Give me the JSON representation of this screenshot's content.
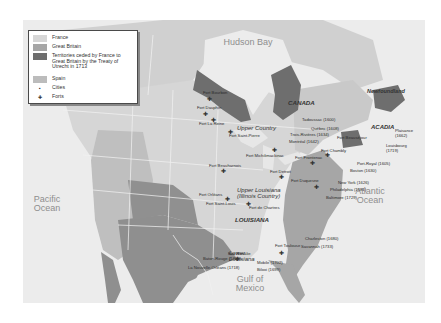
{
  "legend": {
    "items": [
      {
        "label": "France",
        "type": "swatch",
        "color": "#d6d6d6"
      },
      {
        "label": "Great Britain",
        "type": "swatch",
        "color": "#a6a6a6"
      },
      {
        "label": "Territories ceded by France to Great Britain by the Treaty of Utrecht in 1713",
        "type": "swatch",
        "color": "#6e6e6e"
      },
      {
        "label": "Spain",
        "type": "swatch",
        "color": "#bcbcbc"
      },
      {
        "label": "Cities",
        "type": "symbol",
        "symbol": "city-dot-icon"
      },
      {
        "label": "Forts",
        "type": "symbol",
        "symbol": "fort-cross-icon"
      }
    ]
  },
  "water_bodies": {
    "hudson_bay": "Hudson Bay",
    "pacific": "Pacific Ocean",
    "atlantic": "Atlantic Ocean",
    "gulf": "Gulf of Mexico"
  },
  "regions": {
    "canada": "CANADA",
    "newfoundland": "Newfoundland",
    "acadia": "ACADIA",
    "upper_country": "Upper Country",
    "upper_louisiana": "Upper Louisiana (Illinois Country)",
    "louisiana": "LOUISIANA",
    "lower_louisiana": "Lower Louisiana"
  },
  "cities": [
    {
      "name": "Tadoussac (1600)"
    },
    {
      "name": "Québec (1608)"
    },
    {
      "name": "Trois-Rivières (1634)"
    },
    {
      "name": "Montréal (1642)"
    },
    {
      "name": "Plaisance (1662)"
    },
    {
      "name": "Louisbourg (1719)"
    },
    {
      "name": "Port-Royal (1605)"
    },
    {
      "name": "Boston (1630)"
    },
    {
      "name": "New York (1626)"
    },
    {
      "name": "Philadelphia (1681)"
    },
    {
      "name": "Baltimore (1729)"
    },
    {
      "name": "Charleston (1680)"
    },
    {
      "name": "Savannah (1733)"
    },
    {
      "name": "Baton-Rouge (1722)"
    },
    {
      "name": "La Nouvelle-Orléans (1718)"
    },
    {
      "name": "Mobile (1702)"
    },
    {
      "name": "Biloxi (1699)"
    }
  ],
  "forts": [
    {
      "name": "Fort Bourbon"
    },
    {
      "name": "Fort Dauphin"
    },
    {
      "name": "Fort La Reine"
    },
    {
      "name": "Fort Saint-Pierre"
    },
    {
      "name": "Fort Michilimackinac"
    },
    {
      "name": "Fort Beauharnois"
    },
    {
      "name": "Fort Detroit"
    },
    {
      "name": "Fort Frontenac"
    },
    {
      "name": "Fort Chambly"
    },
    {
      "name": "Fort Beauséjour"
    },
    {
      "name": "Fort Duquesne"
    },
    {
      "name": "Fort Orléans"
    },
    {
      "name": "Fort Saint-Louis"
    },
    {
      "name": "Fort de Chartres"
    },
    {
      "name": "Fort Rosalie"
    },
    {
      "name": "Fort Toulouse"
    }
  ]
}
